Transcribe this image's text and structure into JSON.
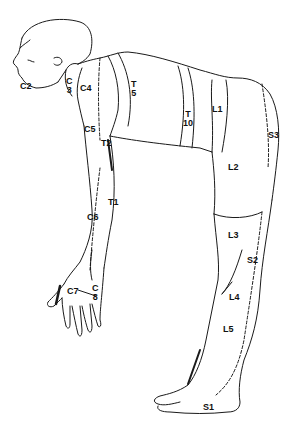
{
  "diagram": {
    "type": "dermatome-map",
    "stroke_color": "#1a1a1a",
    "background": "#ffffff"
  },
  "labels": [
    {
      "id": "C2",
      "text": "C2",
      "x": 20,
      "y": 82
    },
    {
      "id": "C3",
      "text": "C\n3",
      "x": 66,
      "y": 79
    },
    {
      "id": "C4",
      "text": "C4",
      "x": 80,
      "y": 84
    },
    {
      "id": "T5",
      "text": "T\n5",
      "x": 131,
      "y": 83
    },
    {
      "id": "T10",
      "text": "T\n10",
      "x": 185,
      "y": 113
    },
    {
      "id": "L1",
      "text": "L1",
      "x": 212,
      "y": 105
    },
    {
      "id": "S3",
      "text": "S3",
      "x": 268,
      "y": 131
    },
    {
      "id": "C5",
      "text": "C5",
      "x": 84,
      "y": 125
    },
    {
      "id": "T2",
      "text": "T2",
      "x": 101,
      "y": 139
    },
    {
      "id": "L2",
      "text": "L2",
      "x": 228,
      "y": 163
    },
    {
      "id": "T1",
      "text": "T1",
      "x": 108,
      "y": 198
    },
    {
      "id": "C6",
      "text": "C6",
      "x": 87,
      "y": 213
    },
    {
      "id": "L3",
      "text": "L3",
      "x": 228,
      "y": 231
    },
    {
      "id": "S2",
      "text": "S2",
      "x": 247,
      "y": 256
    },
    {
      "id": "C7",
      "text": "C7",
      "x": 67,
      "y": 287
    },
    {
      "id": "C8",
      "text": "C\n8",
      "x": 92,
      "y": 287
    },
    {
      "id": "L4",
      "text": "L4",
      "x": 229,
      "y": 293
    },
    {
      "id": "L5",
      "text": "L5",
      "x": 223,
      "y": 325
    },
    {
      "id": "S1",
      "text": "S1",
      "x": 203,
      "y": 403
    }
  ]
}
